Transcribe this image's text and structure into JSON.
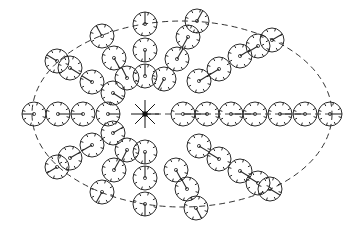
{
  "diagram": {
    "type": "radial-circle-layout",
    "colors": {
      "stroke": "#2a2a2a",
      "background": "#ffffff"
    },
    "boundary": {
      "shape": "ellipse",
      "cx": 182,
      "cy": 114,
      "rx": 150,
      "ry": 93,
      "style": "dashed"
    },
    "center": {
      "x": 145,
      "y": 114,
      "rays": 8,
      "ray_length": 14,
      "marker": "filled-square"
    },
    "center_dashed_line": {
      "x1": 145,
      "y1": 114,
      "x2": 330,
      "y2": 114
    },
    "circle_radius": 12,
    "arms": [
      {
        "name": "left",
        "circles": [
          [
            34,
            114
          ],
          [
            58,
            114
          ],
          [
            83,
            114
          ],
          [
            108,
            114
          ]
        ]
      },
      {
        "name": "right",
        "circles": [
          [
            183,
            114
          ],
          [
            207,
            114
          ],
          [
            231,
            114
          ],
          [
            255,
            114
          ],
          [
            280,
            114
          ],
          [
            305,
            114
          ],
          [
            330,
            114
          ]
        ]
      },
      {
        "name": "top",
        "circles": [
          [
            145,
            24
          ],
          [
            145,
            50
          ],
          [
            145,
            76
          ]
        ]
      },
      {
        "name": "bottom",
        "circles": [
          [
            145,
            152
          ],
          [
            145,
            178
          ],
          [
            145,
            204
          ]
        ]
      },
      {
        "name": "upper-left",
        "circles": [
          [
            57,
            61
          ],
          [
            70,
            68
          ],
          [
            92,
            82
          ],
          [
            113,
            93
          ]
        ]
      },
      {
        "name": "upper-left-top",
        "circles": [
          [
            102,
            36
          ],
          [
            114,
            58
          ],
          [
            127,
            78
          ]
        ]
      },
      {
        "name": "upper-right",
        "circles": [
          [
            199,
            81
          ],
          [
            219,
            69
          ],
          [
            240,
            56
          ],
          [
            258,
            46
          ],
          [
            272,
            40
          ]
        ]
      },
      {
        "name": "upper-right-top",
        "circles": [
          [
            197,
            21
          ],
          [
            188,
            37
          ],
          [
            177,
            59
          ],
          [
            164,
            79
          ]
        ]
      },
      {
        "name": "lower-left",
        "circles": [
          [
            57,
            167
          ],
          [
            70,
            158
          ],
          [
            92,
            145
          ],
          [
            113,
            133
          ]
        ]
      },
      {
        "name": "lower-left-bottom",
        "circles": [
          [
            102,
            192
          ],
          [
            114,
            170
          ],
          [
            127,
            150
          ]
        ]
      },
      {
        "name": "lower-right",
        "circles": [
          [
            199,
            146
          ],
          [
            219,
            159
          ],
          [
            240,
            171
          ],
          [
            258,
            183
          ],
          [
            270,
            189
          ]
        ]
      },
      {
        "name": "lower-right-bottom",
        "circles": [
          [
            176,
            170
          ],
          [
            187,
            189
          ],
          [
            196,
            208
          ]
        ]
      }
    ]
  }
}
